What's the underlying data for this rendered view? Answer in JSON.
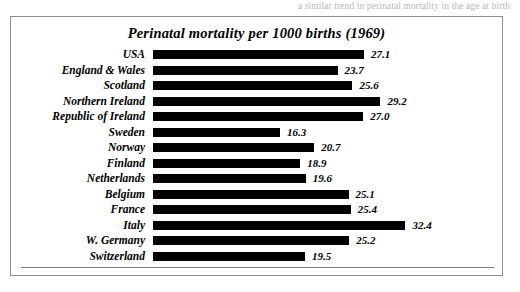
{
  "page": {
    "bleed_text": "a similar trend in perinatal mortality in the age at birth"
  },
  "figure": {
    "title": "Perinatal mortality per 1000 births (1969)"
  },
  "chart_data": {
    "type": "bar",
    "orientation": "horizontal",
    "title": "Perinatal mortality per 1000 births (1969)",
    "xlabel": "",
    "ylabel": "",
    "xlim": [
      0,
      32.4
    ],
    "grid": false,
    "legend": null,
    "value_labels": true,
    "categories": [
      "USA",
      "England & Wales",
      "Scotland",
      "Northern Ireland",
      "Republic of Ireland",
      "Sweden",
      "Norway",
      "Finland",
      "Netherlands",
      "Belgium",
      "France",
      "Italy",
      "W. Germany",
      "Switzerland"
    ],
    "values": [
      27.1,
      23.7,
      25.6,
      29.2,
      27.0,
      16.3,
      20.7,
      18.9,
      19.6,
      25.1,
      25.4,
      32.4,
      25.2,
      19.5
    ],
    "value_text": [
      "27.1",
      "23.7",
      "25.6",
      "29.2",
      "27.0",
      "16.3",
      "20.7",
      "18.9",
      "19.6",
      "25.1",
      "25.4",
      "32.4",
      "25.2",
      "19.5"
    ],
    "bar_color": "#000000",
    "background_color": "#ffffff"
  }
}
